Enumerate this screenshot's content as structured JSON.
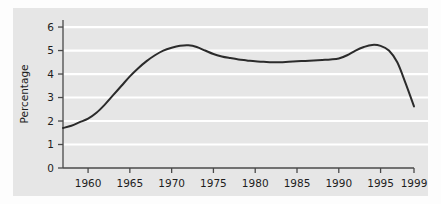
{
  "figure": {
    "panel_bg": "#e6e6e6",
    "page_bg": "#ffffff",
    "gridline_color": "#ffffff",
    "axis_color": "#4a4a4a",
    "series_color": "#2b2b2b"
  },
  "chart_data": {
    "type": "line",
    "title": "",
    "xlabel": "",
    "ylabel": "Percentage",
    "xlim": [
      1957,
      1999
    ],
    "ylim": [
      0,
      6.3
    ],
    "grid": true,
    "legend": "none",
    "x_ticks": [
      1960,
      1965,
      1970,
      1975,
      1980,
      1985,
      1990,
      1995,
      1999
    ],
    "x_tick_labels": [
      "1960",
      "1965",
      "1970",
      "1975",
      "1980",
      "1985",
      "1990",
      "1995",
      "1999"
    ],
    "y_ticks": [
      0,
      1,
      2,
      3,
      4,
      5,
      6
    ],
    "y_tick_labels": [
      "0",
      "1",
      "2",
      "3",
      "4",
      "5",
      "6"
    ],
    "series": [
      {
        "name": "Percentage",
        "x": [
          1957,
          1958,
          1959,
          1960,
          1961,
          1962,
          1963,
          1964,
          1965,
          1966,
          1967,
          1968,
          1969,
          1970,
          1971,
          1972,
          1973,
          1974,
          1975,
          1976,
          1977,
          1978,
          1979,
          1980,
          1981,
          1982,
          1983,
          1984,
          1985,
          1986,
          1987,
          1988,
          1989,
          1990,
          1991,
          1992,
          1993,
          1994,
          1995,
          1996,
          1997,
          1998,
          1999
        ],
        "values": [
          1.7,
          1.8,
          1.95,
          2.1,
          2.35,
          2.7,
          3.1,
          3.5,
          3.9,
          4.25,
          4.55,
          4.8,
          5.0,
          5.12,
          5.2,
          5.22,
          5.15,
          5.0,
          4.85,
          4.75,
          4.68,
          4.62,
          4.58,
          4.54,
          4.52,
          4.5,
          4.5,
          4.52,
          4.54,
          4.56,
          4.58,
          4.6,
          4.62,
          4.66,
          4.8,
          5.0,
          5.15,
          5.24,
          5.2,
          5.0,
          4.5,
          3.6,
          2.62
        ]
      }
    ]
  }
}
